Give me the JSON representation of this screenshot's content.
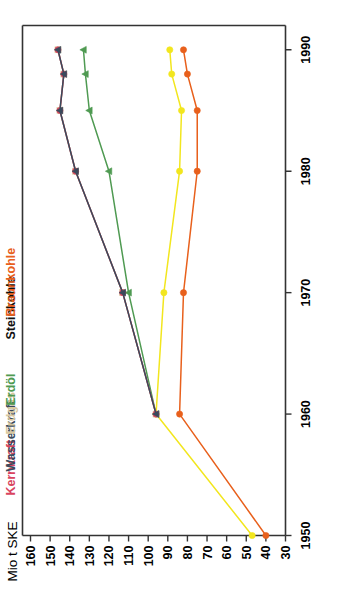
{
  "figure": {
    "unit_label": "Mio t SKE",
    "value_axis": {
      "ticks": [
        "160",
        "150",
        "140",
        "130",
        "120",
        "110",
        "100",
        "90",
        "80",
        "70",
        "60",
        "50",
        "40",
        "30"
      ],
      "min": 30,
      "max": 160
    },
    "year_axis": {
      "ticks": [
        "1950",
        "1960",
        "1970",
        "1980",
        "1990"
      ],
      "min": 1950,
      "max": 1992
    }
  },
  "legend": {
    "items": [
      {
        "label": "Kernkraft",
        "color": "#d9455f"
      },
      {
        "label": "Wasserkraft",
        "color": "#3a4a5c"
      },
      {
        "label": "Erdgas",
        "color": "#d9c9a0"
      },
      {
        "label": "Erdöl",
        "color": "#4f9a52"
      },
      {
        "label": "Steinkohle",
        "color": "#111111"
      },
      {
        "label": "Braunkohle",
        "color": "#e8601c"
      }
    ]
  },
  "chart_data": {
    "type": "line",
    "title": "",
    "subtitle": "",
    "xlabel": "",
    "ylabel": "Mio t SKE",
    "xlim": [
      1950,
      1992
    ],
    "ylim": [
      30,
      160
    ],
    "grid": false,
    "legend_position": "top-left",
    "orientation": "rotated-90",
    "x": [
      1950,
      1960,
      1970,
      1980,
      1985,
      1988,
      1990
    ],
    "series": [
      {
        "name": "Steinkohle",
        "color": "#f2e61e",
        "marker": "circle",
        "values": [
          47,
          96,
          92,
          84,
          83,
          88,
          89
        ]
      },
      {
        "name": "Braunkohle",
        "color": "#e8601c",
        "marker": "circle",
        "values": [
          40,
          84,
          82,
          75,
          75,
          80,
          82
        ]
      },
      {
        "name": "Erdöl",
        "color": "#4f9a52",
        "marker": "triangle",
        "values": [
          null,
          96,
          110,
          120,
          130,
          132,
          133
        ]
      },
      {
        "name": "Erdgas",
        "color": "#d9c9a0",
        "marker": "square",
        "values": [
          null,
          96,
          113,
          137,
          145,
          143,
          146
        ]
      },
      {
        "name": "Kernkraft",
        "color": "#d9455f",
        "marker": "circle",
        "values": [
          null,
          96,
          113,
          137,
          145,
          143,
          146
        ]
      },
      {
        "name": "Wasserkraft",
        "color": "#3a4a5c",
        "marker": "triangle",
        "values": [
          null,
          96,
          113,
          137,
          145,
          143,
          146
        ]
      }
    ]
  }
}
